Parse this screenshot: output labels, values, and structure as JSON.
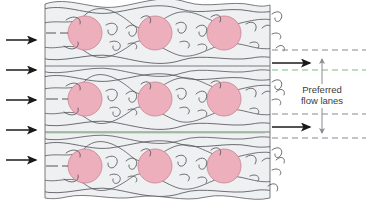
{
  "figure": {
    "background_color": "#ffffff"
  },
  "colors": {
    "nucleus_fill": "#edafbc",
    "nucleus_stroke": "#c98b9b",
    "tissue_fill": "#eff0f1",
    "tissue_stroke": "#6b6b70",
    "fiber_stroke": "#55555c",
    "arrow_color": "#1a1a1a",
    "lane_dash_gray": "#8a8a92",
    "lane_dash_green": "#79c07a",
    "annotation_color": "#6e6e6e",
    "text_color": "#3c3c3c"
  },
  "left_inflow": {
    "name": "inflow-arrows",
    "count": 5,
    "direction": "right",
    "arrow_y_positions": [
      40,
      70,
      100,
      130,
      160
    ],
    "arrow_x_start": 6,
    "arrow_x_end": 38
  },
  "tissue": {
    "name": "tissue-block",
    "x": 45,
    "y": 0,
    "width": 225,
    "height": 203,
    "rows": 3,
    "cells_per_row": 3,
    "nuclei": [
      {
        "cx": 85,
        "cy": 33,
        "r": 17
      },
      {
        "cx": 155,
        "cy": 33,
        "r": 17
      },
      {
        "cx": 224,
        "cy": 33,
        "r": 17
      },
      {
        "cx": 85,
        "cy": 99,
        "r": 17
      },
      {
        "cx": 155,
        "cy": 99,
        "r": 17
      },
      {
        "cx": 224,
        "cy": 99,
        "r": 17
      },
      {
        "cx": 85,
        "cy": 166,
        "r": 17
      },
      {
        "cx": 155,
        "cy": 166,
        "r": 17
      },
      {
        "cx": 224,
        "cy": 166,
        "r": 17
      }
    ],
    "lane_y_positions": [
      66,
      132
    ]
  },
  "right_panel": {
    "name": "flow-lane-legend",
    "dashed_lines": [
      {
        "y": 50,
        "color": "gray"
      },
      {
        "y": 70,
        "color": "green"
      },
      {
        "y": 114,
        "color": "gray"
      },
      {
        "y": 138,
        "color": "gray"
      }
    ],
    "flow_arrows": [
      {
        "y": 63,
        "x_start": 272,
        "x_end": 312
      },
      {
        "y": 127,
        "x_start": 272,
        "x_end": 312
      }
    ],
    "callout": {
      "line_x": 322,
      "line_top": 57,
      "line_bottom": 131,
      "label_line_1": "Preferred",
      "label_line_2": "flow lanes",
      "label_x": 322,
      "label_y_1": 92,
      "label_y_2": 103
    }
  }
}
